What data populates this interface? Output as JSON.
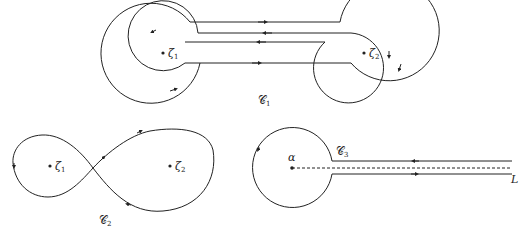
{
  "diagram": {
    "contour1": {
      "label": "𝒞",
      "label_sub": "1",
      "points": [
        {
          "name": "ζ",
          "sub": "1"
        },
        {
          "name": "ζ",
          "sub": "2"
        }
      ]
    },
    "contour2": {
      "label": "𝒞",
      "label_sub": "2",
      "points": [
        {
          "name": "ζ",
          "sub": "1"
        },
        {
          "name": "ζ",
          "sub": "2"
        }
      ]
    },
    "contour3": {
      "label": "𝒞",
      "label_sub": "3",
      "center_label": "α",
      "ray_label": "L"
    },
    "colors": {
      "stroke": "#222222",
      "background": "#ffffff"
    }
  }
}
